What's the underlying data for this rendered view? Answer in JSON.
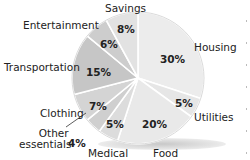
{
  "chart_data": {
    "type": "pie",
    "title": "",
    "categories": [
      "Housing",
      "Utilities",
      "Food",
      "Medical",
      "Other essentials",
      "Clothing",
      "Transportation",
      "Entertainment",
      "Savings"
    ],
    "values": [
      30,
      5,
      20,
      5,
      4,
      7,
      15,
      6,
      8
    ],
    "labels": [
      "30%",
      "5%",
      "20%",
      "5%",
      "4%",
      "7%",
      "15%",
      "6%",
      "8%"
    ],
    "colors": [
      "#ececec",
      "#e6e6e6",
      "#e9e9e9",
      "#dcdcdc",
      "#cfcfcf",
      "#d4d4d4",
      "#c6c6c6",
      "#cdcdcd",
      "#e2e2e2"
    ],
    "legend": "none (labels placed beside slices)",
    "start_angle_deg_clockwise_from_top": 0
  },
  "labels": {
    "savings": "Savings",
    "entertainment": "Entertainment",
    "transportation": "Transportation",
    "clothing": "Clothing",
    "other_line1": "Other",
    "other_line2": "essentials",
    "medical": "Medical",
    "food": "Food",
    "utilities": "Utilities",
    "housing": "Housing"
  },
  "percents": {
    "savings": "8%",
    "entertainment": "6%",
    "transportation": "15%",
    "clothing": "7%",
    "other": "4%",
    "medical": "5%",
    "food": "20%",
    "utilities": "5%",
    "housing": "30%"
  }
}
